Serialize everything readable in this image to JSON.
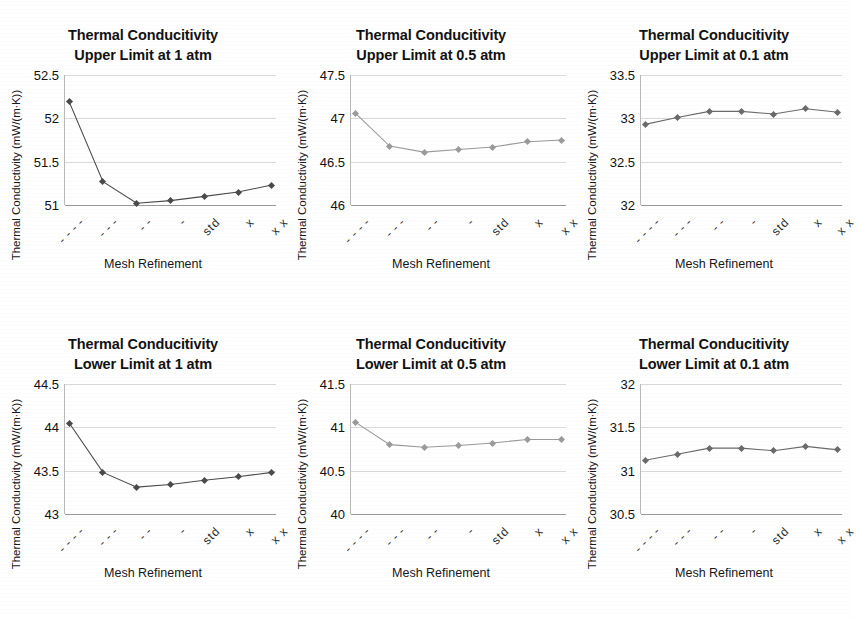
{
  "figure": {
    "axis_title_x": "Mesh Refinement",
    "axis_title_y": "Thermal Conductivity (mW/(m∙K))",
    "mesh_levels": [
      "- - - -",
      "- - -",
      "- -",
      "-",
      "std",
      "x",
      "x x"
    ],
    "line_color_dark": "#4a4a4a",
    "line_color_light": "#9a9a9a",
    "gridline_color": "#d8d8d8",
    "axis_color": "#9a9a9a"
  },
  "chart_data": [
    {
      "id": "upper-1atm",
      "type": "line",
      "title": "Thermal Conducitivity\nUpper Limit at 1 atm",
      "xlabel": "Mesh Refinement",
      "ylabel": "Thermal Conductivity (mW/(m∙K))",
      "categories": [
        "- - - -",
        "- - -",
        "- -",
        "-",
        "std",
        "x",
        "x x"
      ],
      "values": [
        52.19,
        51.27,
        51.02,
        51.05,
        51.1,
        51.15,
        51.23
      ],
      "yticks": [
        "51",
        "51.5",
        "52",
        "52.5"
      ],
      "ylim": [
        51,
        52.5
      ],
      "grid": true,
      "legend": "none",
      "series_color": "#4a4a4a"
    },
    {
      "id": "upper-05atm",
      "type": "line",
      "title": "Thermal Conducitivity\nUpper Limit at 0.5 atm",
      "xlabel": "Mesh Refinement",
      "ylabel": "Thermal Conductivity (mW/(m∙K))",
      "categories": [
        "- - - -",
        "- - -",
        "- -",
        "-",
        "std",
        "x",
        "x x"
      ],
      "values": [
        47.06,
        46.68,
        46.61,
        46.64,
        46.67,
        46.73,
        46.75
      ],
      "yticks": [
        "46",
        "46.5",
        "47",
        "47.5"
      ],
      "ylim": [
        46,
        47.5
      ],
      "grid": true,
      "legend": "none",
      "series_color": "#9a9a9a"
    },
    {
      "id": "upper-01atm",
      "type": "line",
      "title": "Thermal Conducitivity\nUpper Limit at 0.1 atm",
      "xlabel": "Mesh Refinement",
      "ylabel": "Thermal Conductivity (mW/(m∙K))",
      "categories": [
        "- - - -",
        "- - -",
        "- -",
        "-",
        "std",
        "x",
        "x x"
      ],
      "values": [
        32.93,
        33.01,
        33.08,
        33.08,
        33.05,
        33.11,
        33.07
      ],
      "yticks": [
        "32",
        "32.5",
        "33",
        "33.5"
      ],
      "ylim": [
        32,
        33.5
      ],
      "grid": true,
      "legend": "none",
      "series_color": "#6a6a6a"
    },
    {
      "id": "lower-1atm",
      "type": "line",
      "title": "Thermal Conducitivity\nLower Limit at 1 atm",
      "xlabel": "Mesh Refinement",
      "ylabel": "Thermal Conductivity (mW/(m∙K))",
      "categories": [
        "- - - -",
        "- - -",
        "- -",
        "-",
        "std",
        "x",
        "x x"
      ],
      "values": [
        44.05,
        43.48,
        43.31,
        43.34,
        43.39,
        43.43,
        43.48
      ],
      "yticks": [
        "43",
        "43.5",
        "44",
        "44.5"
      ],
      "ylim": [
        43,
        44.5
      ],
      "grid": true,
      "legend": "none",
      "series_color": "#4a4a4a"
    },
    {
      "id": "lower-05atm",
      "type": "line",
      "title": "Thermal Conducitivity\nLower Limit at 0.5 atm",
      "xlabel": "Mesh Refinement",
      "ylabel": "Thermal Conductivity (mW/(m∙K))",
      "categories": [
        "- - - -",
        "- - -",
        "- -",
        "-",
        "std",
        "x",
        "x x"
      ],
      "values": [
        41.06,
        40.8,
        40.77,
        40.79,
        40.82,
        40.86,
        40.86
      ],
      "yticks": [
        "40",
        "40.5",
        "41",
        "41.5"
      ],
      "ylim": [
        40,
        41.5
      ],
      "grid": true,
      "legend": "none",
      "series_color": "#9a9a9a"
    },
    {
      "id": "lower-01atm",
      "type": "line",
      "title": "Thermal Conducitivity\nLower Limit at 0.1 atm",
      "xlabel": "Mesh Refinement",
      "ylabel": "Thermal Conductivity (mW/(m∙K))",
      "categories": [
        "- - - -",
        "- - -",
        "- -",
        "-",
        "std",
        "x",
        "x x"
      ],
      "values": [
        31.12,
        31.19,
        31.26,
        31.26,
        31.23,
        31.28,
        31.24
      ],
      "yticks": [
        "30.5",
        "31",
        "31.5",
        "32"
      ],
      "ylim": [
        30.5,
        32
      ],
      "grid": true,
      "legend": "none",
      "series_color": "#6a6a6a"
    }
  ]
}
